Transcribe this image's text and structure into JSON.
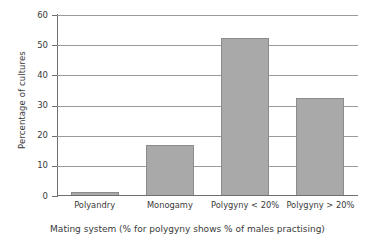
{
  "chart_data": {
    "type": "bar",
    "title": "",
    "subtitle": "",
    "xlabel": "Mating system (% for polygyny shows % of males practising)",
    "ylabel": "Percentage of cultures",
    "categories": [
      "Polyandry",
      "Monogamy",
      "Polygyny < 20%",
      "Polygyny > 20%"
    ],
    "values": [
      1.5,
      17,
      52.5,
      32.5
    ],
    "ylim": [
      0,
      60
    ],
    "yticks": [
      0,
      10,
      20,
      30,
      40,
      50,
      60
    ],
    "ytick_labels": [
      "0",
      "10",
      "20",
      "30",
      "40",
      "50",
      "60"
    ],
    "grid": "horizontal",
    "legend": "none",
    "bar_color": "#a9a9a9",
    "bar_edge_color": "#8c8c8c",
    "axis_color": "#6f6f6f",
    "grid_color": "#9a9a9a",
    "text_color": "#3a3a3a",
    "background": "#ffffff"
  }
}
